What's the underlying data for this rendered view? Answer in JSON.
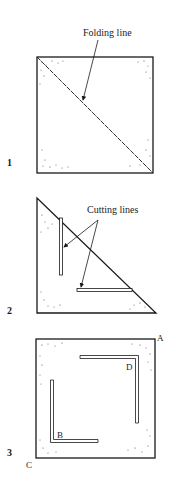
{
  "figures": [
    {
      "number": "1",
      "label": "Folding line",
      "shape": "square",
      "description": "Square sheet with diagonal folding line"
    },
    {
      "number": "2",
      "label": "Cutting lines",
      "shape": "triangle",
      "description": "Folded triangle with two cutting lines"
    },
    {
      "number": "3",
      "shape": "square",
      "corner_labels": {
        "A": "A",
        "B": "B",
        "C": "C",
        "D": "D"
      },
      "description": "Unfolded square with two L-shaped cuts"
    }
  ],
  "colors": {
    "ink": "#1a1a1a",
    "background": "#ffffff"
  }
}
